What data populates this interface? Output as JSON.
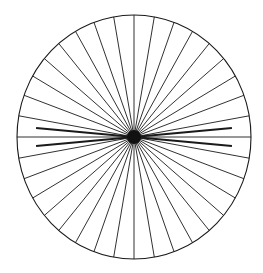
{
  "canvas": {
    "width": 263,
    "height": 273,
    "background_color": "#ffffff",
    "title": "Spoked wheel radial diagram"
  },
  "figure": {
    "name": "spoked-wheel",
    "line_color": "#1a1a1a",
    "rim_color": "#1a1a1a",
    "hub_color": "#111111",
    "spoke_stroke_width": 0.9,
    "rim_stroke_width": 1.1,
    "emphasis_stroke_width": 2.0
  },
  "chart_data": {
    "type": "pie",
    "xlabel": "",
    "ylabel": "",
    "center_x": 134,
    "center_y": 137,
    "radius_x": 117,
    "radius_y": 122,
    "hub_radius": 7,
    "spoke_count": 36,
    "spoke_angle_step_degrees": 10,
    "categories": [
      "0",
      "10",
      "20",
      "30",
      "40",
      "50",
      "60",
      "70",
      "80",
      "90",
      "100",
      "110",
      "120",
      "130",
      "140",
      "150",
      "160",
      "170",
      "180",
      "190",
      "200",
      "210",
      "220",
      "230",
      "240",
      "250",
      "260",
      "270",
      "280",
      "290",
      "300",
      "310",
      "320",
      "330",
      "340",
      "350"
    ],
    "values": [
      10,
      10,
      10,
      10,
      10,
      10,
      10,
      10,
      10,
      10,
      10,
      10,
      10,
      10,
      10,
      10,
      10,
      10,
      10,
      10,
      10,
      10,
      10,
      10,
      10,
      10,
      10,
      10,
      10,
      10,
      10,
      10,
      10,
      10,
      10,
      10
    ],
    "angles_degrees": [
      0,
      10,
      20,
      30,
      40,
      50,
      60,
      70,
      80,
      90,
      100,
      110,
      120,
      130,
      140,
      150,
      160,
      170,
      180,
      190,
      200,
      210,
      220,
      230,
      240,
      250,
      260,
      270,
      280,
      290,
      300,
      310,
      320,
      330,
      340,
      350
    ],
    "emphasized_angles_degrees": [
      5,
      175,
      185,
      355
    ],
    "grid": false,
    "legend": "none"
  }
}
